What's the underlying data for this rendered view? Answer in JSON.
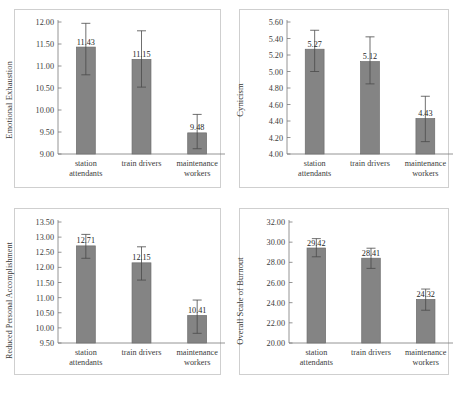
{
  "figure": {
    "background": "#ffffff",
    "bar_color": "#848484",
    "bar_border_color": "#6d6d6d",
    "axis_color": "#7a7a7a",
    "panel_border_color": "#cfcfcf"
  },
  "categories": [
    "station attendants",
    "train drivers",
    "maintenance workers"
  ],
  "category_lines": [
    [
      "station",
      "attendants"
    ],
    [
      "train drivers",
      ""
    ],
    [
      "maintenance",
      "workers"
    ]
  ],
  "panels": [
    {
      "id": "emotional-exhaustion",
      "ylabel": "Emotional Exhaustion",
      "ymin": 9.0,
      "ymax": 12.0,
      "ystep": 0.5,
      "ticks": [
        "12.00",
        "11.50",
        "11.00",
        "10.50",
        "10.00",
        "9.50",
        "9.00"
      ],
      "values": [
        11.43,
        11.15,
        9.48
      ],
      "value_labels": [
        "11.43",
        "11.15",
        "9.48"
      ],
      "err_low": [
        10.8,
        10.52,
        9.12
      ],
      "err_high": [
        11.97,
        11.8,
        9.9
      ]
    },
    {
      "id": "cynicism",
      "ylabel": "Cynicism",
      "ymin": 4.0,
      "ymax": 5.6,
      "ystep": 0.2,
      "ticks": [
        "5.60",
        "5.40",
        "5.20",
        "5.00",
        "4.80",
        "4.60",
        "4.40",
        "4.20",
        "4.00"
      ],
      "values": [
        5.27,
        5.12,
        4.43
      ],
      "value_labels": [
        "5.27",
        "5.12",
        "4.43"
      ],
      "err_low": [
        5.0,
        4.85,
        4.15
      ],
      "err_high": [
        5.5,
        5.42,
        4.7
      ]
    },
    {
      "id": "reduced-personal-accomplishment",
      "ylabel": "Reduced Personal Accomplishment",
      "ymin": 9.5,
      "ymax": 13.5,
      "ystep": 0.5,
      "ticks": [
        "13.50",
        "13.00",
        "12.50",
        "12.00",
        "11.50",
        "11.00",
        "10.50",
        "10.00",
        "9.50"
      ],
      "values": [
        12.71,
        12.15,
        10.41
      ],
      "value_labels": [
        "12.71",
        "12.15",
        "10.41"
      ],
      "err_low": [
        12.3,
        11.58,
        9.82
      ],
      "err_high": [
        13.09,
        12.68,
        10.92
      ]
    },
    {
      "id": "overall-scale-of-burnout",
      "ylabel": "Overall Scale of Burnout",
      "ymin": 20.0,
      "ymax": 32.0,
      "ystep": 2.0,
      "ticks": [
        "32.00",
        "30.00",
        "28.00",
        "26.00",
        "24.00",
        "22.00",
        "20.00"
      ],
      "values": [
        29.42,
        28.41,
        24.32
      ],
      "value_labels": [
        "29.42",
        "28.41",
        "24.32"
      ],
      "err_low": [
        28.55,
        27.4,
        23.25
      ],
      "err_high": [
        30.35,
        29.4,
        25.35
      ]
    }
  ],
  "chart_data": [
    {
      "type": "bar",
      "title": "Emotional Exhaustion",
      "xlabel": "",
      "ylabel": "Emotional Exhaustion",
      "categories": [
        "station attendants",
        "train drivers",
        "maintenance workers"
      ],
      "values": [
        11.43,
        11.15,
        9.48
      ],
      "error_low": [
        10.8,
        10.52,
        9.12
      ],
      "error_high": [
        11.97,
        11.8,
        9.9
      ],
      "ylim": [
        9.0,
        12.0
      ],
      "ytick_step": 0.5,
      "yticks": [
        9.0,
        9.5,
        10.0,
        10.5,
        11.0,
        11.5,
        12.0
      ],
      "grid": false,
      "legend": "none",
      "data_labels": [
        "11.43",
        "11.15",
        "9.48"
      ]
    },
    {
      "type": "bar",
      "title": "Cynicism",
      "xlabel": "",
      "ylabel": "Cynicism",
      "categories": [
        "station attendants",
        "train drivers",
        "maintenance workers"
      ],
      "values": [
        5.27,
        5.12,
        4.43
      ],
      "error_low": [
        5.0,
        4.85,
        4.15
      ],
      "error_high": [
        5.5,
        5.42,
        4.7
      ],
      "ylim": [
        4.0,
        5.6
      ],
      "ytick_step": 0.2,
      "yticks": [
        4.0,
        4.2,
        4.4,
        4.6,
        4.8,
        5.0,
        5.2,
        5.4,
        5.6
      ],
      "grid": false,
      "legend": "none",
      "data_labels": [
        "5.27",
        "5.12",
        "4.43"
      ]
    },
    {
      "type": "bar",
      "title": "Reduced Personal Accomplishment",
      "xlabel": "",
      "ylabel": "Reduced Personal Accomplishment",
      "categories": [
        "station attendants",
        "train drivers",
        "maintenance workers"
      ],
      "values": [
        12.71,
        12.15,
        10.41
      ],
      "error_low": [
        12.3,
        11.58,
        9.82
      ],
      "error_high": [
        13.09,
        12.68,
        10.92
      ],
      "ylim": [
        9.5,
        13.5
      ],
      "ytick_step": 0.5,
      "yticks": [
        9.5,
        10.0,
        10.5,
        11.0,
        11.5,
        12.0,
        12.5,
        13.0,
        13.5
      ],
      "grid": false,
      "legend": "none",
      "data_labels": [
        "12.71",
        "12.15",
        "10.41"
      ]
    },
    {
      "type": "bar",
      "title": "Overall Scale of Burnout",
      "xlabel": "",
      "ylabel": "Overall Scale of Burnout",
      "categories": [
        "station attendants",
        "train drivers",
        "maintenance workers"
      ],
      "values": [
        29.42,
        28.41,
        24.32
      ],
      "error_low": [
        28.55,
        27.4,
        23.25
      ],
      "error_high": [
        30.35,
        29.4,
        25.35
      ],
      "ylim": [
        20.0,
        32.0
      ],
      "ytick_step": 2.0,
      "yticks": [
        20.0,
        22.0,
        24.0,
        26.0,
        28.0,
        30.0,
        32.0
      ],
      "grid": false,
      "legend": "none",
      "data_labels": [
        "29.42",
        "28.41",
        "24.32"
      ]
    }
  ]
}
